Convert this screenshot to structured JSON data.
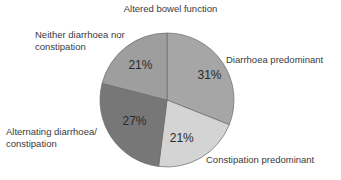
{
  "chart_data": {
    "type": "pie",
    "title": "Altered bowel function",
    "categories": [
      "Diarrhoea predominant",
      "Constipation predominant",
      "Alternating diarrhoea/ constipation",
      "Neither diarrhoea nor constipation"
    ],
    "values": [
      31,
      21,
      27,
      21
    ],
    "value_labels": [
      "31%",
      "21%",
      "27%",
      "21%"
    ],
    "colors": [
      "#a6a6a6",
      "#d4d4d4",
      "#777777",
      "#9e9e9e"
    ],
    "start_angle": "12 o'clock",
    "direction": "clockwise",
    "legend": "none (external slice labels)"
  },
  "labels": {
    "diarrhoea": "Diarrhoea predominant",
    "constipation": "Constipation predominant",
    "alternating_line1": "Alternating diarrhoea/",
    "alternating_line2": "constipation",
    "neither_line1": "Neither diarrhoea nor",
    "neither_line2": "constipation"
  }
}
